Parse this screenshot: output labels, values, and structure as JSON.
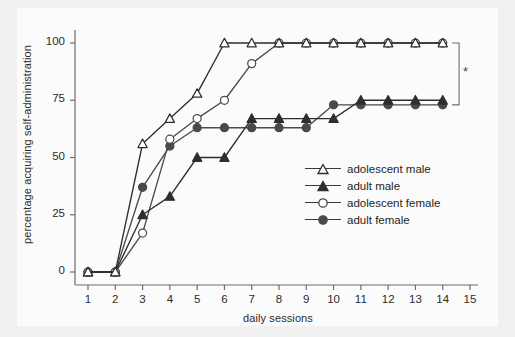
{
  "chart_data": {
    "type": "line",
    "title": "",
    "subtitle": "",
    "xlabel": "daily sessions",
    "ylabel": "percentage acquiring self-administration",
    "x": [
      1,
      2,
      3,
      4,
      5,
      6,
      7,
      8,
      9,
      10,
      11,
      12,
      13,
      14
    ],
    "xlim": [
      0.6,
      15.2
    ],
    "ylim": [
      -4,
      104
    ],
    "xticks": [
      "1",
      "2",
      "3",
      "4",
      "5",
      "6",
      "7",
      "8",
      "9",
      "10",
      "11",
      "12",
      "13",
      "14",
      "15"
    ],
    "xtick_values": [
      1,
      2,
      3,
      4,
      5,
      6,
      7,
      8,
      9,
      10,
      11,
      12,
      13,
      14,
      15
    ],
    "yticks": [
      "0",
      "25",
      "50",
      "75",
      "100"
    ],
    "ytick_values": [
      0,
      25,
      50,
      75,
      100
    ],
    "grid": false,
    "legend_position": "center-right",
    "series": [
      {
        "name": "adolescent male",
        "marker": "open-triangle",
        "color": "#2e2e2e",
        "values": [
          0,
          0,
          56,
          67,
          78,
          100,
          100,
          100,
          100,
          100,
          100,
          100,
          100,
          100
        ]
      },
      {
        "name": "adult male",
        "marker": "filled-triangle",
        "color": "#2e2e2e",
        "values": [
          0,
          0,
          25,
          33,
          50,
          50,
          67,
          67,
          67,
          67,
          75,
          75,
          75,
          75
        ]
      },
      {
        "name": "adolescent female",
        "marker": "open-circle",
        "color": "#4a4a4a",
        "values": [
          0,
          0,
          17,
          58,
          67,
          75,
          91,
          100,
          100,
          100,
          100,
          100,
          100,
          100
        ]
      },
      {
        "name": "adult female",
        "marker": "filled-circle",
        "color": "#4a4a4a",
        "values": [
          0,
          0,
          37,
          55,
          63,
          63,
          63,
          63,
          63,
          73,
          73,
          73,
          73,
          73
        ]
      }
    ],
    "annotations": [
      {
        "name": "significance-bracket",
        "symbol": "*",
        "from_value": 100,
        "to_value": 73,
        "at_x": 14.6
      }
    ]
  },
  "axes": {
    "x_title": "daily sessions",
    "y_title": "percentage acquiring self-administration"
  },
  "legend": {
    "items": [
      {
        "label": "adolescent male"
      },
      {
        "label": "adult male"
      },
      {
        "label": "adolescent female"
      },
      {
        "label": "adult female"
      }
    ]
  },
  "significance": {
    "star": "*"
  },
  "colors": {
    "page_background": "#f0f0f0",
    "plot_background": "#fbfbfb",
    "axis": "#6e6e6e",
    "series_dark": "#2e2e2e",
    "series_mid": "#4a4a4a",
    "text": "#2b2b2b"
  }
}
